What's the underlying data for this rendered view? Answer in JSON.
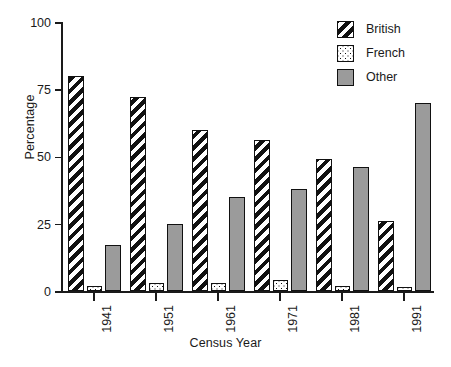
{
  "chart_data": {
    "type": "bar",
    "title": "",
    "xlabel": "Census Year",
    "ylabel": "Percentage",
    "categories": [
      "1941",
      "1951",
      "1961",
      "1971",
      "1981",
      "1991"
    ],
    "series": [
      {
        "name": "British",
        "values": [
          80,
          72,
          60,
          56,
          49,
          26
        ],
        "fill": "diagonal-hatch",
        "color": "#111111"
      },
      {
        "name": "French",
        "values": [
          2,
          3,
          3,
          4,
          2,
          1.5
        ],
        "fill": "dotted",
        "color": "#ffffff"
      },
      {
        "name": "Other",
        "values": [
          17,
          25,
          35,
          38,
          46,
          70
        ],
        "fill": "solid-gray",
        "color": "#9b9b9b"
      }
    ],
    "ylim": [
      0,
      100
    ],
    "yticks": [
      0,
      25,
      50,
      75,
      100
    ],
    "ytick_labels": [
      "0",
      "25",
      "50",
      "75",
      "100"
    ],
    "grid": false,
    "legend_position": "top-right",
    "legend_entries": [
      "British",
      "French",
      "Other"
    ],
    "xtick_rotation": 90
  },
  "axes": {
    "ylabel": "Percentage",
    "xlabel": "Census Year"
  },
  "legend": {
    "items": [
      {
        "label": "British"
      },
      {
        "label": "French"
      },
      {
        "label": "Other"
      }
    ]
  },
  "colors": {
    "axis": "#1a1a1a",
    "other_fill": "#9b9b9b",
    "hatch": "#111111",
    "background": "#ffffff"
  }
}
